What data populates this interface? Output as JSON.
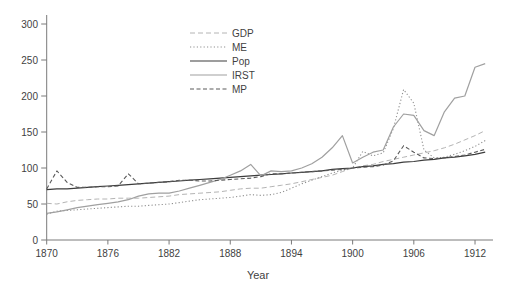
{
  "chart_data": {
    "type": "line",
    "title": "",
    "xlabel": "Year",
    "ylabel": "",
    "xlim": [
      1869.5,
      1913.8
    ],
    "ylim": [
      0,
      300
    ],
    "grid": false,
    "legend_position": "upper-left-inside",
    "xticks": [
      1870,
      1876,
      1882,
      1888,
      1894,
      1900,
      1906,
      1912
    ],
    "yticks": [
      0,
      50,
      100,
      150,
      200,
      250,
      300
    ],
    "x": [
      1870,
      1871,
      1872,
      1873,
      1874,
      1875,
      1876,
      1877,
      1878,
      1879,
      1880,
      1881,
      1882,
      1883,
      1884,
      1885,
      1886,
      1887,
      1888,
      1889,
      1890,
      1891,
      1892,
      1893,
      1894,
      1895,
      1896,
      1897,
      1898,
      1899,
      1900,
      1901,
      1902,
      1903,
      1904,
      1905,
      1906,
      1907,
      1908,
      1909,
      1910,
      1911,
      1912,
      1913
    ],
    "series": [
      {
        "name": "GDP",
        "style": "dashed",
        "color": "#b4b4b4",
        "width": 1,
        "values": [
          51,
          50,
          53,
          55,
          56,
          57,
          57,
          58,
          58,
          58,
          59,
          60,
          61,
          63,
          64,
          65,
          66,
          67,
          69,
          71,
          72,
          72,
          74,
          76,
          78,
          81,
          84,
          87,
          90,
          95,
          100,
          103,
          105,
          109,
          112,
          115,
          118,
          121,
          124,
          128,
          133,
          139,
          145,
          152
        ]
      },
      {
        "name": "ME",
        "style": "dotted",
        "color": "#8f8f8f",
        "width": 1.1,
        "values": [
          36,
          40,
          41,
          42,
          43,
          44,
          45,
          46,
          47,
          47,
          48,
          49,
          50,
          52,
          54,
          56,
          57,
          58,
          59,
          61,
          63,
          62,
          63,
          66,
          72,
          78,
          83,
          88,
          93,
          97,
          100,
          123,
          117,
          121,
          155,
          209,
          190,
          125,
          114,
          115,
          119,
          124,
          130,
          138
        ]
      },
      {
        "name": "Pop",
        "style": "solid",
        "color": "#3c3c3c",
        "width": 1.2,
        "values": [
          70,
          71,
          71,
          72,
          73,
          74,
          75,
          76,
          77,
          78,
          79,
          80,
          81,
          82,
          83,
          84,
          85,
          86,
          87,
          88,
          89,
          90,
          91,
          92,
          93,
          94,
          95,
          96,
          98,
          99,
          100,
          102,
          103,
          105,
          106,
          108,
          109,
          111,
          112,
          114,
          115,
          117,
          119,
          122
        ]
      },
      {
        "name": "IRST",
        "style": "solid",
        "color": "#a0a0a0",
        "width": 1.2,
        "values": [
          37,
          39,
          42,
          45,
          47,
          49,
          51,
          53,
          56,
          61,
          64,
          65,
          65,
          68,
          72,
          76,
          80,
          84,
          90,
          96,
          105,
          89,
          96,
          95,
          96,
          100,
          106,
          115,
          128,
          145,
          107,
          115,
          122,
          125,
          157,
          175,
          173,
          152,
          145,
          178,
          197,
          200,
          240,
          245
        ]
      },
      {
        "name": "MP",
        "style": "dashed",
        "color": "#5a5a5a",
        "width": 1.1,
        "values": [
          71,
          96,
          80,
          73,
          73,
          74,
          74,
          75,
          92,
          78,
          79,
          80,
          81,
          83,
          83,
          82,
          82,
          83,
          84,
          85,
          86,
          88,
          92,
          92,
          93,
          94,
          95,
          96,
          97,
          98,
          100,
          101,
          102,
          104,
          110,
          131,
          122,
          114,
          113,
          114,
          116,
          118,
          122,
          126
        ]
      }
    ],
    "axis_color": "#7a7a7a",
    "text_color": "#3f3f3f",
    "background_color": "#ffffff"
  }
}
